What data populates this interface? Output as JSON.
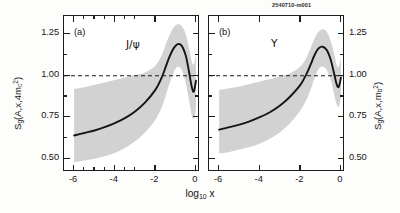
{
  "figure": {
    "run_id": "2540710-m001",
    "xaxis": {
      "label_text": "log",
      "label_sub": "10",
      "label_var": "x",
      "ticks": [
        "-6",
        "-4",
        "-2",
        "0"
      ],
      "tick_values": [
        -6,
        -4,
        -2,
        0
      ],
      "range": [
        -6.5,
        0.2
      ],
      "minor_ticks": [
        -5,
        -3,
        -1,
        -5.5,
        -4.5,
        -3.5,
        -2.5,
        -1.5,
        -0.5
      ]
    },
    "yaxis": {
      "ticks": [
        "1.25",
        "1.00",
        "0.75",
        "0.50"
      ],
      "tick_values": [
        1.25,
        1.0,
        0.75,
        0.5
      ],
      "range": [
        0.42,
        1.36
      ],
      "minor_ticks": [
        1.125,
        0.875,
        0.625
      ]
    },
    "panels": [
      {
        "tag": "(a)",
        "species": "J/ψ",
        "yaxis_title": {
          "pre": "S",
          "pre_sub": "g",
          "body": "(A,x,4m",
          "body_sub": "c",
          "body_sup": "2",
          "post": ")"
        }
      },
      {
        "tag": "(b)",
        "species": "Υ",
        "yaxis_title": {
          "pre": "S",
          "pre_sub": "g",
          "body": "(A,x,m",
          "body_sub": "b",
          "body_sup": "2",
          "post": ")"
        }
      }
    ],
    "colors": {
      "curve": "#151515",
      "band": "#d2d2d2",
      "frame": "#1c1c1c",
      "reference_line": "#1c1c1c",
      "background": "#ffffff"
    }
  },
  "chart_data": {
    "type": "line",
    "title": "",
    "xlabel": "log10 x",
    "ylabel": "Sg(A,x,Q^2)",
    "xlim": [
      -6.5,
      0.2
    ],
    "ylim": [
      0.42,
      1.36
    ],
    "grid": false,
    "legend": "none",
    "reference_lines": [
      {
        "y": 1.0,
        "style": "dashed"
      }
    ],
    "panels": [
      {
        "tag": "(a)",
        "species": "J/psi",
        "scale_label": "4m_c^2",
        "x": [
          -6.0,
          -5.5,
          -5.0,
          -4.5,
          -4.0,
          -3.5,
          -3.0,
          -2.5,
          -2.0,
          -1.7,
          -1.5,
          -1.3,
          -1.1,
          -0.9,
          -0.7,
          -0.5,
          -0.35,
          -0.2,
          -0.1,
          0.0
        ],
        "central": [
          0.64,
          0.655,
          0.67,
          0.69,
          0.715,
          0.745,
          0.785,
          0.84,
          0.915,
          0.985,
          1.05,
          1.115,
          1.165,
          1.19,
          1.18,
          1.12,
          1.03,
          0.93,
          0.905,
          0.97
        ],
        "band_low": [
          0.48,
          0.49,
          0.5,
          0.515,
          0.535,
          0.565,
          0.605,
          0.66,
          0.735,
          0.805,
          0.875,
          0.955,
          1.02,
          1.055,
          1.035,
          0.955,
          0.86,
          0.76,
          0.74,
          0.8
        ],
        "band_high": [
          0.92,
          0.93,
          0.945,
          0.96,
          0.975,
          0.99,
          1.005,
          1.02,
          1.06,
          1.12,
          1.185,
          1.245,
          1.29,
          1.31,
          1.3,
          1.25,
          1.17,
          1.085,
          1.07,
          1.13
        ]
      },
      {
        "tag": "(b)",
        "species": "Upsilon",
        "scale_label": "m_b^2",
        "x": [
          -6.0,
          -5.5,
          -5.0,
          -4.5,
          -4.0,
          -3.5,
          -3.0,
          -2.5,
          -2.0,
          -1.7,
          -1.5,
          -1.3,
          -1.1,
          -0.9,
          -0.7,
          -0.5,
          -0.35,
          -0.2,
          -0.1,
          0.0
        ],
        "central": [
          0.675,
          0.69,
          0.705,
          0.725,
          0.75,
          0.78,
          0.82,
          0.875,
          0.945,
          1.01,
          1.065,
          1.125,
          1.165,
          1.175,
          1.155,
          1.095,
          1.02,
          0.945,
          0.935,
          0.99
        ],
        "band_low": [
          0.53,
          0.54,
          0.555,
          0.57,
          0.59,
          0.62,
          0.66,
          0.715,
          0.79,
          0.855,
          0.915,
          0.985,
          1.04,
          1.055,
          1.035,
          0.975,
          0.895,
          0.825,
          0.815,
          0.875
        ],
        "band_high": [
          0.915,
          0.925,
          0.935,
          0.95,
          0.965,
          0.98,
          0.995,
          1.015,
          1.055,
          1.11,
          1.165,
          1.225,
          1.265,
          1.28,
          1.265,
          1.21,
          1.14,
          1.065,
          1.055,
          1.11
        ]
      }
    ]
  }
}
